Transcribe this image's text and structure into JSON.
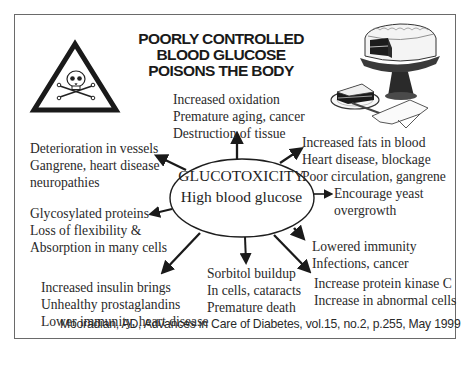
{
  "title": {
    "lines": [
      "POORLY CONTROLLED",
      "BLOOD GLUCOSE",
      "POISONS THE BODY"
    ]
  },
  "icons": {
    "warning": "poison-warning-triangle-icon",
    "illustration": "cake-illustration"
  },
  "center": {
    "line1": "GLUCOTOXICITY",
    "line2": "High blood glucose"
  },
  "effects": {
    "top": [
      "Increased oxidation",
      "Premature aging, cancer",
      "Destruction of tissue"
    ],
    "upper_left": [
      "Deterioration in vessels",
      "Gangrene, heart disease",
      "neuropathies"
    ],
    "upper_right": [
      "Increased fats in blood",
      "Heart disease, blockage",
      "Poor circulation, gangrene"
    ],
    "left": [
      "Glycosylated proteins",
      "Loss of flexibility &",
      "Absorption in many cells"
    ],
    "right": [
      "Encourage yeast",
      "overgrowth"
    ],
    "lower_right_1": [
      "Lowered immunity",
      "Infections, cancer"
    ],
    "lower_right_2": [
      "Increase protein kinase C",
      "Increase in abnormal cells"
    ],
    "bottom": [
      "Sorbitol buildup",
      "In cells, cataracts",
      "Premature death"
    ],
    "lower_left": [
      "Increased insulin brings",
      "Unhealthy prostaglandins",
      "Lower immunity, heart disease"
    ]
  },
  "citation": "Mooradian, AD, Advances in Care of Diabetes, vol.15, no.2, p.255, May 1999",
  "colors": {
    "border": "#6a6a6a",
    "text": "#2a2a2a",
    "arrow": "#1a1a1a"
  }
}
